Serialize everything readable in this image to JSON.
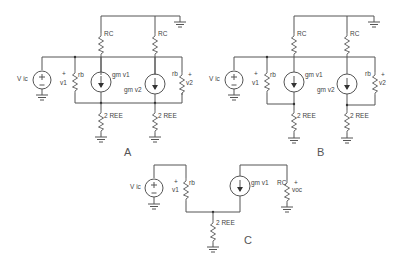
{
  "figure": {
    "captions": {
      "a": "A",
      "b": "B",
      "c": "C"
    }
  },
  "labels": {
    "source": "V ic",
    "plus": "+",
    "minus": "-",
    "rc": "RC",
    "rb": "rb",
    "ree": "2 REE",
    "gm_v1": "gm v1",
    "gm_v2": "gm v2",
    "v1": "v1",
    "v2": "v2",
    "voc": "voc"
  },
  "colors": {
    "wire": "#555555",
    "text": "#444444",
    "background": "#ffffff"
  }
}
